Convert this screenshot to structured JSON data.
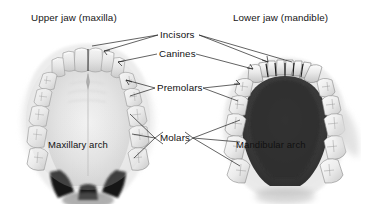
{
  "figure": {
    "kind": "dental-anatomy-diagram",
    "background_color": "#ffffff",
    "text_color": "#1a1a1a",
    "titles": {
      "left": "Upper jaw (maxilla)",
      "right": "Lower jaw (mandible)"
    },
    "arch_labels": {
      "left": "Maxillary arch",
      "right": "Mandibular arch"
    },
    "tooth_group_labels": [
      {
        "id": "incisors",
        "label": "Incisors"
      },
      {
        "id": "canines",
        "label": "Canines"
      },
      {
        "id": "premolars",
        "label": "Premolars"
      },
      {
        "id": "molars",
        "label": "Molars"
      }
    ]
  }
}
